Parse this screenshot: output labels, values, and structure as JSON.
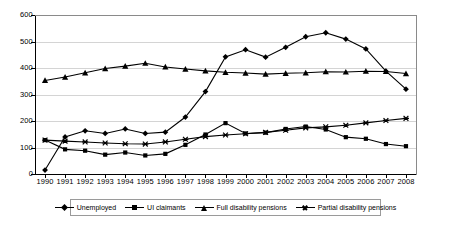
{
  "chart_data": {
    "type": "line",
    "title": "",
    "subtitle": "",
    "xlabel": "",
    "ylabel": "",
    "ylim": [
      0,
      600
    ],
    "ytick_step": 100,
    "yticks": [
      "0",
      "100",
      "200",
      "300",
      "400",
      "500",
      "600"
    ],
    "grid": "horizontal",
    "legend_position": "bottom",
    "categories": [
      "1990",
      "1991",
      "1992",
      "1993",
      "1994",
      "1995",
      "1996",
      "1997",
      "1998",
      "1999",
      "2000",
      "2001",
      "2002",
      "2003",
      "2004",
      "2005",
      "2006",
      "2007",
      "2008"
    ],
    "series": [
      {
        "name": "Unemployed",
        "marker": "diamond",
        "values": [
          15,
          140,
          163,
          153,
          170,
          153,
          158,
          215,
          311,
          442,
          469,
          441,
          478,
          518,
          533,
          509,
          472,
          388,
          320
        ]
      },
      {
        "name": "UI claimants",
        "marker": "square",
        "values": [
          128,
          93,
          88,
          73,
          81,
          70,
          76,
          110,
          149,
          192,
          153,
          156,
          170,
          179,
          168,
          139,
          133,
          113,
          105
        ]
      },
      {
        "name": "Full disability pensions",
        "marker": "triangle",
        "values": [
          353,
          366,
          382,
          398,
          407,
          418,
          404,
          396,
          389,
          384,
          381,
          377,
          380,
          382,
          386,
          385,
          388,
          387,
          379
        ]
      },
      {
        "name": "Partial disability pensions",
        "marker": "cross",
        "values": [
          128,
          124,
          121,
          117,
          114,
          113,
          121,
          131,
          141,
          147,
          152,
          157,
          165,
          174,
          178,
          184,
          193,
          202,
          210
        ]
      }
    ]
  },
  "legend": {
    "items": [
      {
        "label": "Unemployed"
      },
      {
        "label": "UI claimants"
      },
      {
        "label": "Full disability pensions"
      },
      {
        "label": "Partial disability pensions"
      }
    ]
  },
  "colors": {
    "series_line": "#000000",
    "grid": "#d4d4d4",
    "axis": "#000000",
    "background": "#ffffff"
  }
}
